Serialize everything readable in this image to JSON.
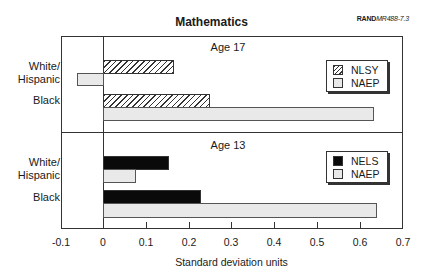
{
  "header": {
    "title": "Mathematics",
    "ref_bold": "RAND",
    "ref_italic": "MR488-7.3"
  },
  "panels": [
    {
      "label": "Age 17",
      "legend": [
        {
          "name": "NLSY",
          "style": "hatch"
        },
        {
          "name": "NAEP",
          "style": "light"
        }
      ]
    },
    {
      "label": "Age 13",
      "legend": [
        {
          "name": "NELS",
          "style": "solid"
        },
        {
          "name": "NAEP",
          "style": "light"
        }
      ]
    }
  ],
  "categories": [
    "White/ Hispanic",
    "Black"
  ],
  "axis": {
    "xlabel": "Standard deviation units",
    "ticks": [
      "-0.1",
      "0",
      "0.1",
      "0.2",
      "0.3",
      "0.4",
      "0.5",
      "0.6",
      "0.7"
    ]
  },
  "chart_data": {
    "type": "bar",
    "orientation": "horizontal",
    "title": "Mathematics",
    "xlabel": "Standard deviation units",
    "ylabel": "",
    "xlim": [
      -0.1,
      0.7
    ],
    "xticks": [
      -0.1,
      0,
      0.1,
      0.2,
      0.3,
      0.4,
      0.5,
      0.6,
      0.7
    ],
    "grid": false,
    "panels": [
      {
        "name": "Age 17",
        "categories": [
          "White/Hispanic",
          "Black"
        ],
        "series": [
          {
            "name": "NLSY",
            "pattern": "hatched",
            "values": [
              0.16,
              0.25
            ]
          },
          {
            "name": "NAEP",
            "pattern": "light gray",
            "values": [
              -0.06,
              0.63
            ]
          }
        ],
        "legend_position": "upper right"
      },
      {
        "name": "Age 13",
        "categories": [
          "White/Hispanic",
          "Black"
        ],
        "series": [
          {
            "name": "NELS",
            "pattern": "black",
            "values": [
              0.15,
              0.23
            ]
          },
          {
            "name": "NAEP",
            "pattern": "light gray",
            "values": [
              0.08,
              0.64
            ]
          }
        ],
        "legend_position": "upper right"
      }
    ],
    "annotations": [
      "RANDMR488-7.3"
    ]
  }
}
